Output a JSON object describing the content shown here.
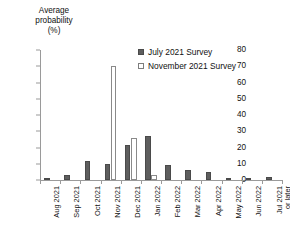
{
  "chart_data": {
    "type": "bar",
    "title": "",
    "xlabel": "",
    "ylabel": "Average probability (%)",
    "ylabel_lines": [
      "Average",
      "probability",
      "(%)"
    ],
    "ylim": [
      0,
      80
    ],
    "yticks": [
      0,
      10,
      20,
      30,
      40,
      50,
      60,
      70,
      80
    ],
    "ytick_labels": [
      "0",
      "10",
      "20",
      "30",
      "40",
      "50",
      "60",
      "70",
      "80"
    ],
    "grid": false,
    "legend_position": "upper center",
    "categories": [
      "Aug 2021",
      "Sep 2021",
      "Oct 2021",
      "Nov 2021",
      "Dec 2021",
      "Jan 2022",
      "Feb 2022",
      "Mar 2022",
      "Apr 2022",
      "May 2022",
      "Jun 2022",
      "Jul 2021 or later"
    ],
    "category_lines": [
      [
        "Aug 2021"
      ],
      [
        "Sep 2021"
      ],
      [
        "Oct 2021"
      ],
      [
        "Nov 2021"
      ],
      [
        "Dec 2021"
      ],
      [
        "Jan 2022"
      ],
      [
        "Feb 2022"
      ],
      [
        "Mar 2022"
      ],
      [
        "Apr 2022"
      ],
      [
        "May 2022"
      ],
      [
        "Jun 2022"
      ],
      [
        "Jul 2021",
        "or later"
      ]
    ],
    "series": [
      {
        "name": "July 2021 Survey",
        "color": "#5e5e5e",
        "values": [
          1,
          3,
          12,
          10,
          21.5,
          27,
          9,
          6,
          5,
          1,
          1,
          2
        ]
      },
      {
        "name": "November 2021 Survey",
        "color": "#ffffff",
        "values": [
          0,
          0,
          0,
          70,
          26,
          3,
          0,
          0,
          0,
          0,
          0,
          0
        ]
      }
    ]
  },
  "legend": {
    "items": [
      {
        "label": "July 2021 Survey",
        "swatch": "filled-dark-square"
      },
      {
        "label": "November 2021 Survey",
        "swatch": "open-white-square"
      }
    ]
  }
}
